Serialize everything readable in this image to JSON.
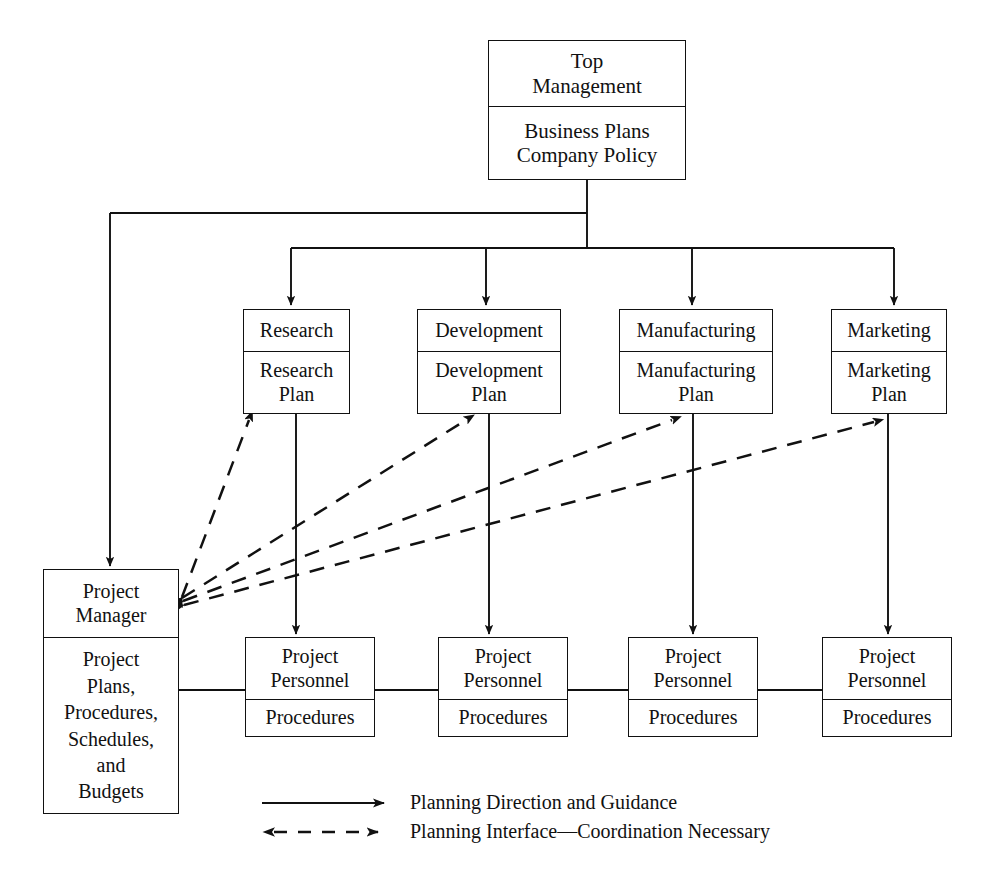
{
  "diagram": {
    "line_color": "#111111",
    "background_color": "#ffffff"
  },
  "nodes": {
    "top_management": {
      "header": "Top\nManagement",
      "body": "Business Plans\nCompany Policy"
    },
    "departments": [
      {
        "header": "Research",
        "body": "Research\nPlan"
      },
      {
        "header": "Development",
        "body": "Development\nPlan"
      },
      {
        "header": "Manufacturing",
        "body": "Manufacturing\nPlan"
      },
      {
        "header": "Marketing",
        "body": "Marketing\nPlan"
      }
    ],
    "project_manager": {
      "header": "Project\nManager",
      "body": "Project\nPlans,\nProcedures,\nSchedules,\nand\nBudgets"
    },
    "personnel": [
      {
        "header": "Project\nPersonnel",
        "body": "Procedures"
      },
      {
        "header": "Project\nPersonnel",
        "body": "Procedures"
      },
      {
        "header": "Project\nPersonnel",
        "body": "Procedures"
      },
      {
        "header": "Project\nPersonnel",
        "body": "Procedures"
      }
    ]
  },
  "legend": {
    "items": [
      {
        "style": "solid-arrow",
        "label": "Planning Direction and Guidance"
      },
      {
        "style": "dashed-double-arrow",
        "label": "Planning Interface—Coordination Necessary"
      }
    ]
  }
}
